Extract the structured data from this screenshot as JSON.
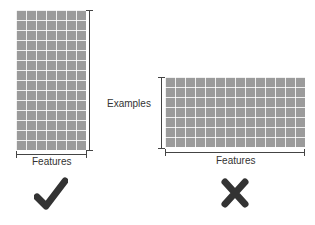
{
  "diagram": {
    "good_example": {
      "grid": {
        "columns": 7,
        "rows": 14
      },
      "x_axis_label": "Features",
      "verdict_icon": "checkmark-icon",
      "verdict": "correct"
    },
    "bad_example": {
      "grid": {
        "columns": 14,
        "rows": 7
      },
      "x_axis_label": "Features",
      "verdict_icon": "cross-icon",
      "verdict": "incorrect"
    },
    "y_axis_label": "Examples",
    "colors": {
      "grid_fill": "#9b9b9b",
      "grid_lines": "#ffffff",
      "axis": "#444444",
      "mark": "#333333"
    }
  }
}
